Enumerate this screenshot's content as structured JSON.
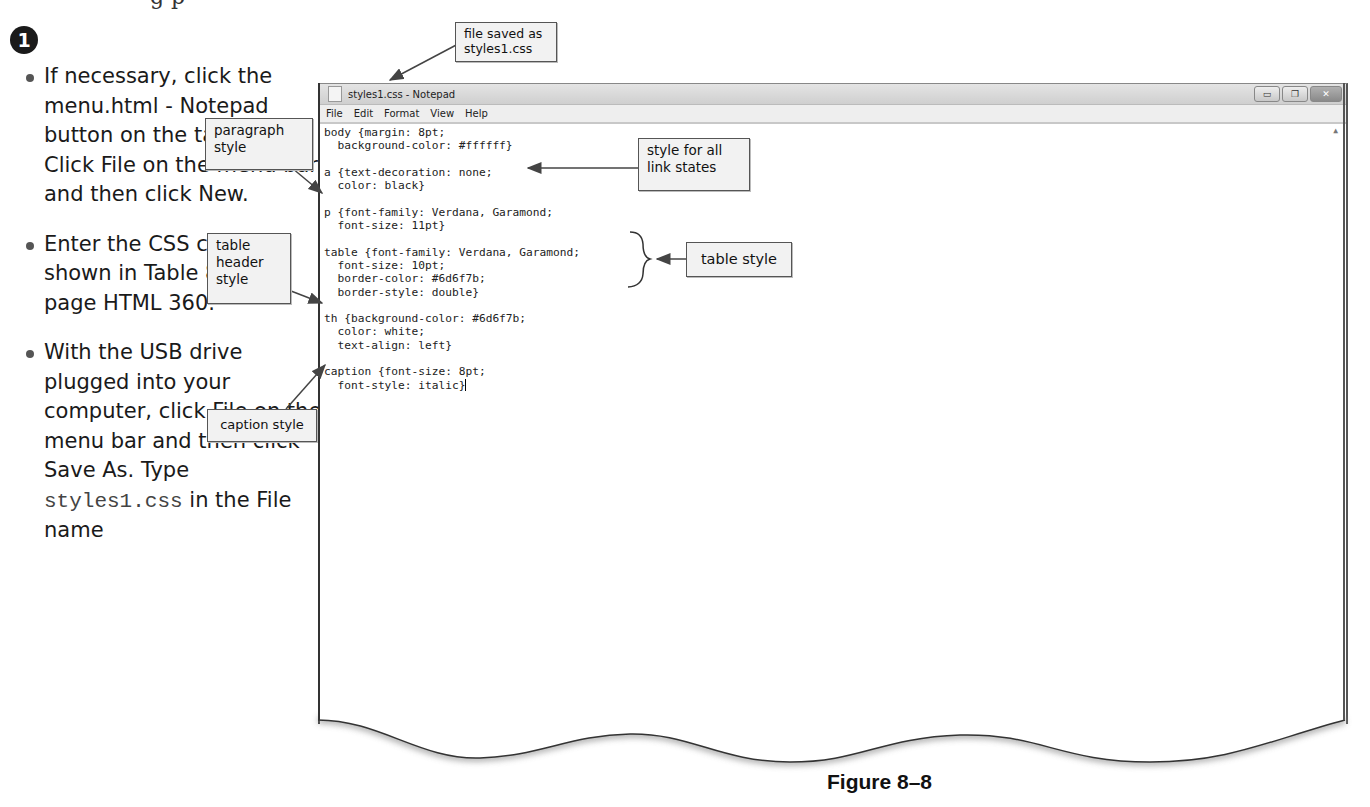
{
  "page": {
    "step_number": "1",
    "top_cut_text": "g p",
    "instructions": [
      {
        "text": "If necessary, click the menu.html - Notepad button on the taskbar. Click File on the menu bar and then click New."
      },
      {
        "text": "Enter the CSS code as shown in Table 8–5 on page HTML 360."
      },
      {
        "text_before": "With the USB drive plugged into your computer, click File on the menu bar and then click Save As. Type ",
        "code": "styles1.css",
        "text_after": " in the File name"
      }
    ],
    "figure_caption": "Figure 8–8"
  },
  "window": {
    "title": "styles1.css - Notepad",
    "controls": {
      "minimize": "▭",
      "maximize": "❐",
      "close": "✕"
    },
    "menu": [
      "File",
      "Edit",
      "Format",
      "View",
      "Help"
    ],
    "code_lines": [
      "body {margin: 8pt;",
      "  background-color: #ffffff}",
      "",
      "a {text-decoration: none;",
      "  color: black}",
      "",
      "p {font-family: Verdana, Garamond;",
      "  font-size: 11pt}",
      "",
      "table {font-family: Verdana, Garamond;",
      "  font-size: 10pt;",
      "  border-color: #6d6f7b;",
      "  border-style: double}",
      "",
      "th {background-color: #6d6f7b;",
      "  color: white;",
      "  text-align: left}",
      "",
      "caption {font-size: 8pt;",
      "  font-style: italic}"
    ]
  },
  "callouts": {
    "file_saved": "file saved as styles1.css",
    "paragraph": "paragraph style",
    "link": "style for all link states",
    "table": "table style",
    "table_header": "table header style",
    "caption": "caption style"
  }
}
